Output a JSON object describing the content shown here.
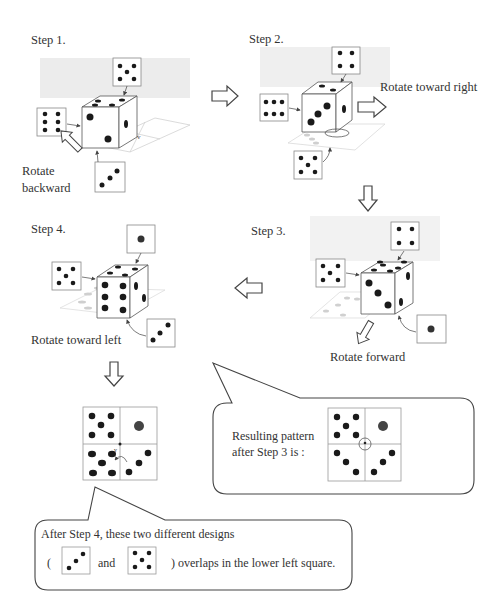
{
  "steps": [
    {
      "title": "Step 1.",
      "action": "Rotate backward",
      "faces": {
        "top_box": 5,
        "left_box": 6,
        "bottom_box": 3
      }
    },
    {
      "title": "Step 2.",
      "action": "Rotate toward right",
      "faces": {
        "top_box": 4,
        "left_box": 6,
        "bottom_box": 5
      }
    },
    {
      "title": "Step 3.",
      "action": "Rotate forward",
      "faces": {
        "top_box": 4,
        "left_box": 5,
        "bottom_box": 1
      }
    },
    {
      "title": "Step 4.",
      "action": "Rotate toward left",
      "faces": {
        "top_box": 1,
        "left_box": 5,
        "bottom_box": 3
      }
    }
  ],
  "callout_step3": {
    "line1": "Resulting pattern",
    "line2": "after Step 3 is :",
    "grid": {
      "top_left": 5,
      "top_right": 1,
      "bottom_left": 3,
      "bottom_right": 3
    }
  },
  "callout_step4": {
    "line1": "After Step 4, these two different designs",
    "open_paren": "(",
    "and": "and",
    "line2_end": ") overlaps in the lower left square.",
    "designs": [
      3,
      5
    ]
  },
  "final_grid": {
    "top_left": 5,
    "top_right": 1,
    "bottom_left": "3+5 overlap",
    "bottom_right": 3
  },
  "colors": {
    "stroke": "#555555",
    "pip": "#1a1a1a",
    "shadow": "#cccccc",
    "plane": "#e6e6e6"
  }
}
